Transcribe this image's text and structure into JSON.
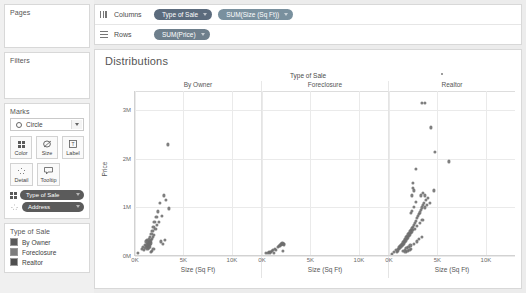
{
  "sidebar": {
    "pages": {
      "title": "Pages"
    },
    "filters": {
      "title": "Filters"
    },
    "marks": {
      "title": "Marks",
      "mark_type": "Circle",
      "buttons": [
        {
          "label": "Color",
          "icon": "color-squares-icon"
        },
        {
          "label": "Size",
          "icon": "size-icon"
        },
        {
          "label": "Label",
          "icon": "label-icon"
        },
        {
          "label": "Detail",
          "icon": "detail-icon"
        },
        {
          "label": "Tooltip",
          "icon": "tooltip-icon"
        }
      ],
      "pills": [
        {
          "label": "Type of Sale",
          "role": "color"
        },
        {
          "label": "Address",
          "role": "detail"
        }
      ]
    },
    "legend": {
      "title": "Type of Sale",
      "items": [
        {
          "label": "By Owner",
          "color": "#5b5b5b"
        },
        {
          "label": "Foreclosure",
          "color": "#7d7d7d"
        },
        {
          "label": "Realtor",
          "color": "#4f4f4f"
        }
      ]
    }
  },
  "shelves": {
    "columns": {
      "name": "Columns",
      "pills": [
        "Type of Sale",
        "SUM(Size (Sq Ft))"
      ]
    },
    "rows": {
      "name": "Rows",
      "pills": [
        "SUM(Price)"
      ]
    }
  },
  "chart_data": {
    "type": "scatter",
    "title": "Distributions",
    "column_field_title": "Type of Sale",
    "xlabel": "Size (Sq Ft)",
    "ylabel": "Price",
    "xlim": [
      0,
      13000
    ],
    "ylim": [
      0,
      3400000
    ],
    "xticks": [
      0,
      5000,
      10000
    ],
    "xticklabels": [
      "0K",
      "5K",
      "10K"
    ],
    "yticks": [
      0,
      1000000,
      2000000,
      3000000
    ],
    "yticklabels": [
      "0M",
      "1M",
      "2M",
      "3M"
    ],
    "grid": true,
    "legend_position": "sidebar",
    "panels": [
      {
        "name": "By Owner",
        "points": [
          [
            300,
            60000
          ],
          [
            700,
            150000
          ],
          [
            820,
            180000
          ],
          [
            900,
            120000
          ],
          [
            1000,
            230000
          ],
          [
            1050,
            160000
          ],
          [
            1100,
            300000
          ],
          [
            1150,
            210000
          ],
          [
            1200,
            250000
          ],
          [
            1220,
            180000
          ],
          [
            1250,
            330000
          ],
          [
            1280,
            140000
          ],
          [
            1300,
            260000
          ],
          [
            1320,
            200000
          ],
          [
            1350,
            310000
          ],
          [
            1380,
            170000
          ],
          [
            1400,
            280000
          ],
          [
            1420,
            220000
          ],
          [
            1450,
            350000
          ],
          [
            1480,
            190000
          ],
          [
            1500,
            300000
          ],
          [
            1520,
            240000
          ],
          [
            1550,
            400000
          ],
          [
            1580,
            260000
          ],
          [
            1600,
            330000
          ],
          [
            1650,
            290000
          ],
          [
            1700,
            450000
          ],
          [
            1750,
            350000
          ],
          [
            1800,
            520000
          ],
          [
            1850,
            400000
          ],
          [
            1900,
            600000
          ],
          [
            1950,
            430000
          ],
          [
            2000,
            700000
          ],
          [
            2100,
            560000
          ],
          [
            2200,
            800000
          ],
          [
            2300,
            640000
          ],
          [
            2400,
            920000
          ],
          [
            2500,
            700000
          ],
          [
            2600,
            1100000
          ],
          [
            2800,
            820000
          ],
          [
            3000,
            1250000
          ],
          [
            3200,
            1150000
          ],
          [
            3500,
            980000
          ],
          [
            2700,
            300000
          ],
          [
            2900,
            250000
          ],
          [
            3100,
            330000
          ],
          [
            3400,
            2300000
          ],
          [
            1600,
            80000
          ],
          [
            1750,
            110000
          ],
          [
            1900,
            140000
          ]
        ]
      },
      {
        "name": "Foreclosure",
        "points": [
          [
            400,
            60000
          ],
          [
            700,
            90000
          ],
          [
            900,
            80000
          ],
          [
            1100,
            120000
          ],
          [
            1300,
            140000
          ],
          [
            1450,
            130000
          ],
          [
            1600,
            180000
          ],
          [
            1750,
            200000
          ],
          [
            1900,
            230000
          ],
          [
            2000,
            250000
          ],
          [
            2100,
            260000
          ],
          [
            2200,
            255000
          ],
          [
            2300,
            240000
          ],
          [
            2150,
            110000
          ],
          [
            1200,
            70000
          ],
          [
            1000,
            100000
          ],
          [
            1850,
            215000
          ],
          [
            2050,
            245000
          ],
          [
            800,
            75000
          ],
          [
            600,
            65000
          ]
        ]
      },
      {
        "name": "Realtor",
        "points": [
          [
            300,
            50000
          ],
          [
            500,
            90000
          ],
          [
            700,
            120000
          ],
          [
            800,
            80000
          ],
          [
            900,
            150000
          ],
          [
            950,
            110000
          ],
          [
            1000,
            180000
          ],
          [
            1050,
            140000
          ],
          [
            1100,
            200000
          ],
          [
            1150,
            160000
          ],
          [
            1200,
            230000
          ],
          [
            1250,
            190000
          ],
          [
            1300,
            250000
          ],
          [
            1350,
            210000
          ],
          [
            1400,
            280000
          ],
          [
            1450,
            240000
          ],
          [
            1500,
            300000
          ],
          [
            1550,
            260000
          ],
          [
            1600,
            330000
          ],
          [
            1650,
            290000
          ],
          [
            1700,
            360000
          ],
          [
            1750,
            320000
          ],
          [
            1800,
            390000
          ],
          [
            1850,
            350000
          ],
          [
            1900,
            420000
          ],
          [
            1950,
            380000
          ],
          [
            2000,
            450000
          ],
          [
            2050,
            410000
          ],
          [
            2100,
            480000
          ],
          [
            2150,
            440000
          ],
          [
            2200,
            510000
          ],
          [
            2250,
            470000
          ],
          [
            2300,
            540000
          ],
          [
            2350,
            500000
          ],
          [
            2400,
            570000
          ],
          [
            2450,
            530000
          ],
          [
            2500,
            600000
          ],
          [
            2600,
            640000
          ],
          [
            2700,
            690000
          ],
          [
            2800,
            730000
          ],
          [
            2900,
            780000
          ],
          [
            3000,
            820000
          ],
          [
            3100,
            870000
          ],
          [
            3200,
            900000
          ],
          [
            3300,
            950000
          ],
          [
            3400,
            1000000
          ],
          [
            3500,
            1050000
          ],
          [
            3600,
            1100000
          ],
          [
            3700,
            1000000
          ],
          [
            3800,
            1150000
          ],
          [
            4000,
            1200000
          ],
          [
            4200,
            1100000
          ],
          [
            2400,
            1250000
          ],
          [
            2500,
            1500000
          ],
          [
            2600,
            1350000
          ],
          [
            2450,
            1400000
          ],
          [
            2800,
            1800000
          ],
          [
            3300,
            1250000
          ],
          [
            3500,
            1300000
          ],
          [
            3700,
            1250000
          ],
          [
            3400,
            3150000
          ],
          [
            3700,
            3150000
          ],
          [
            4300,
            2650000
          ],
          [
            4700,
            2150000
          ],
          [
            4600,
            1350000
          ],
          [
            3900,
            1050000
          ],
          [
            6200,
            1950000
          ],
          [
            1400,
            100000
          ],
          [
            1600,
            130000
          ],
          [
            1800,
            160000
          ],
          [
            2000,
            190000
          ],
          [
            2200,
            220000
          ],
          [
            1700,
            85000
          ],
          [
            1900,
            105000
          ],
          [
            2100,
            125000
          ],
          [
            2300,
            145000
          ],
          [
            2600,
            250000
          ],
          [
            2900,
            300000
          ],
          [
            3100,
            350000
          ],
          [
            3400,
            400000
          ],
          [
            2700,
            560000
          ],
          [
            2900,
            620000
          ],
          [
            3150,
            680000
          ],
          [
            3450,
            750000
          ],
          [
            2250,
            880000
          ],
          [
            2350,
            930000
          ],
          [
            2550,
            1020000
          ],
          [
            2750,
            1120000
          ]
        ]
      }
    ]
  }
}
